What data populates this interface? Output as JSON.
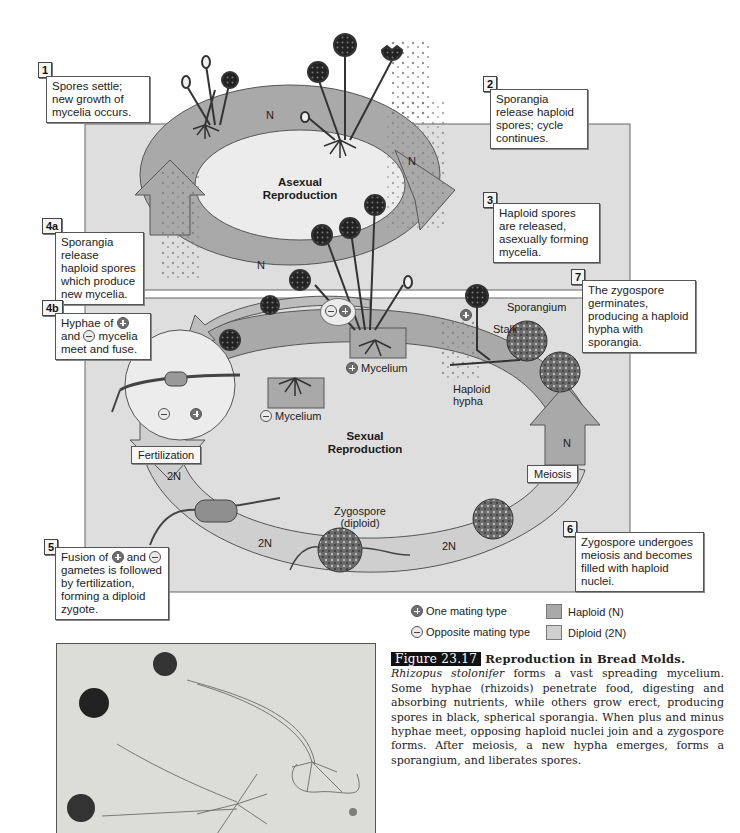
{
  "diagram": {
    "steps": [
      {
        "id": "1",
        "text": "Spores settle; new growth of mycelia occurs."
      },
      {
        "id": "2",
        "text": "Sporangia release haploid spores; cycle continues."
      },
      {
        "id": "3",
        "text": "Haploid spores are released, asexually forming mycelia."
      },
      {
        "id": "4a",
        "text": "Sporangia release haploid spores which produce new mycelia."
      },
      {
        "id": "4b",
        "text_parts": [
          "Hyphae of",
          "and",
          "mycelia meet and fuse."
        ]
      },
      {
        "id": "5",
        "text_parts": [
          "Fusion of",
          "and",
          "gametes is followed by fertilization, forming a diploid zygote."
        ]
      },
      {
        "id": "6",
        "text": "Zygospore undergoes meiosis and becomes filled with haploid nuclei."
      },
      {
        "id": "7",
        "text": "The zygospore germinates, producing a haploid hypha with sporangia."
      }
    ],
    "cycles": {
      "asexual": "Asexual Reproduction",
      "sexual": "Sexual Reproduction"
    },
    "ploidy_labels": {
      "n": "N",
      "two_n": "2N"
    },
    "stage_tags": {
      "fertilization": "Fertilization",
      "meiosis": "Meiosis"
    },
    "structure_labels": {
      "sporangium": "Sporangium",
      "stalk": "Stalk",
      "haploid_hypha": "Haploid hypha",
      "plus_mycelium": "Mycelium",
      "minus_mycelium": "Mycelium",
      "zygospore": "Zygospore",
      "zygospore_note": "(diploid)"
    }
  },
  "legend": {
    "plus": "One mating type",
    "minus": "Opposite mating type",
    "haploid": "Haploid (N)",
    "diploid": "Diploid (2N)",
    "haploid_color": "#a9a9a9",
    "diploid_color": "#cfcfcf"
  },
  "caption": {
    "figure_number": "Figure 23.17",
    "title": "Reproduction in Bread Molds.",
    "species": "Rhizopus stolonifer",
    "body": "forms a vast spreading mycelium. Some hyphae (rhizoids) penetrate food, digesting and absorbing nutrients, while others grow erect, producing spores in black, spherical sporangia. When plus and minus hyphae meet, opposing haploid nuclei join and a zygospore forms. After meiosis, a new hypha emerges, forms a sporangium, and liberates spores."
  },
  "colors": {
    "panel": "#dedede",
    "haploid_arc": "#a9a9a9",
    "diploid_arc": "#cfcfcf",
    "inner_ellipse": "#ececec"
  }
}
